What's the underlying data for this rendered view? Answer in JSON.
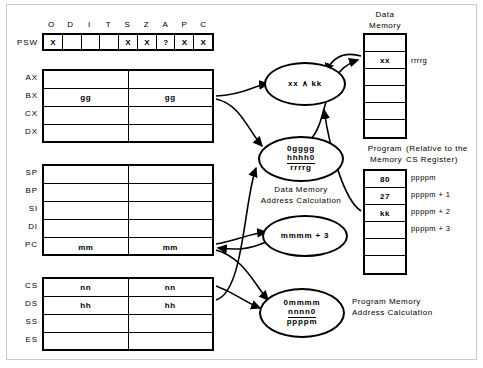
{
  "psw": {
    "label": "PSW",
    "flags": [
      {
        "name": "O",
        "value": "X"
      },
      {
        "name": "D",
        "value": ""
      },
      {
        "name": "I",
        "value": ""
      },
      {
        "name": "T",
        "value": ""
      },
      {
        "name": "S",
        "value": "X"
      },
      {
        "name": "Z",
        "value": "X"
      },
      {
        "name": "A",
        "value": "?"
      },
      {
        "name": "P",
        "value": "X"
      },
      {
        "name": "C",
        "value": "X"
      }
    ]
  },
  "general_registers": [
    {
      "name": "AX",
      "high": "",
      "low": ""
    },
    {
      "name": "BX",
      "high": "gg",
      "low": "gg"
    },
    {
      "name": "CX",
      "high": "",
      "low": ""
    },
    {
      "name": "DX",
      "high": "",
      "low": ""
    }
  ],
  "pointer_registers": [
    {
      "name": "SP",
      "high": "",
      "low": ""
    },
    {
      "name": "BP",
      "high": "",
      "low": ""
    },
    {
      "name": "SI",
      "high": "",
      "low": ""
    },
    {
      "name": "DI",
      "high": "",
      "low": ""
    },
    {
      "name": "PC",
      "high": "mm",
      "low": "mm"
    }
  ],
  "segment_registers": [
    {
      "name": "CS",
      "high": "nn",
      "low": "nn"
    },
    {
      "name": "DS",
      "high": "hh",
      "low": "hh"
    },
    {
      "name": "SS",
      "high": "",
      "low": ""
    },
    {
      "name": "ES",
      "high": "",
      "low": ""
    }
  ],
  "data_memory": {
    "title_line1": "Data",
    "title_line2": "Memory",
    "cells": [
      "",
      "xx",
      "",
      "",
      "",
      ""
    ],
    "address_label": "rrrrg"
  },
  "program_memory": {
    "title_line1": "Program",
    "title_line2": "Memory",
    "note_line1": "(Relative to the",
    "note_line2": "CS Register)",
    "cells": [
      "80",
      "27",
      "kk",
      "",
      "",
      ""
    ],
    "addresses": [
      "ppppm",
      "ppppm + 1",
      "ppppm + 2",
      "ppppm + 3"
    ]
  },
  "operations": {
    "and_oval": "xx  ∧  kk",
    "data_addr_oval": {
      "line1": "0gggg",
      "line2": "hhhh0",
      "line3": "rrrrg"
    },
    "data_addr_caption_line1": "Data Memory",
    "data_addr_caption_line2": "Address Calculation",
    "pc_increment_oval": "mmmm + 3",
    "prog_addr_oval": {
      "line1": "0mmmm",
      "line2": "nnnn0",
      "line3": "ppppm"
    },
    "prog_addr_caption_line1": "Program Memory",
    "prog_addr_caption_line2": "Address Calculation"
  }
}
